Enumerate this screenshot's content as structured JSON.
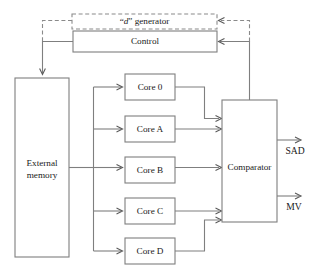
{
  "diagram": {
    "blocks": {
      "d_generator": {
        "label_prefix": "“",
        "label_italic": "d",
        "label_suffix": "” generator",
        "full_label": "“d” generator",
        "style": "dashed",
        "x": 72,
        "y": 14,
        "w": 145,
        "h": 15
      },
      "control": {
        "label": "Control",
        "style": "solid",
        "x": 73,
        "y": 31,
        "w": 144,
        "h": 21
      },
      "external_memory": {
        "label_line1": "External",
        "label_line2": "memory",
        "full_label": "External memory",
        "style": "solid",
        "x": 15,
        "y": 78,
        "w": 54,
        "h": 179
      },
      "comparator": {
        "label": "Comparator",
        "style": "solid",
        "x": 222,
        "y": 100,
        "w": 55,
        "h": 122
      }
    },
    "cores": [
      {
        "label": "Core 0",
        "x": 125,
        "y": 74,
        "w": 50,
        "h": 26
      },
      {
        "label": "Core A",
        "x": 125,
        "y": 116,
        "w": 50,
        "h": 26
      },
      {
        "label": "Core B",
        "x": 125,
        "y": 157,
        "w": 50,
        "h": 26
      },
      {
        "label": "Core C",
        "x": 125,
        "y": 198,
        "w": 50,
        "h": 26
      },
      {
        "label": "Core D",
        "x": 125,
        "y": 238,
        "w": 50,
        "h": 26
      }
    ],
    "outputs": [
      {
        "label": "SAD",
        "x": 295,
        "y": 152
      },
      {
        "label": "MV",
        "x": 294,
        "y": 208
      }
    ],
    "colors": {
      "background": "#ffffff",
      "box_stroke": "#7f7f7f",
      "dashed_stroke": "#8a8a8a",
      "wire_stroke": "#7f7f7f",
      "text": "#1a1a1a"
    }
  }
}
